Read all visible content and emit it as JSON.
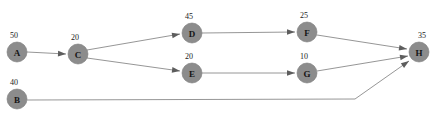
{
  "diagram": {
    "background_color": "#ffffff",
    "node_fill_color": "#8c8c8c",
    "edge_color": "#8a8a8a",
    "arrow_color": "#5d5d5d",
    "label_color": "#1a1a1a",
    "nodes": [
      {
        "id": "A",
        "label": "A",
        "weight": "50",
        "cx": 17,
        "cy": 52,
        "r": 10,
        "wx": 14,
        "wy": 38
      },
      {
        "id": "B",
        "label": "B",
        "weight": "40",
        "cx": 17,
        "cy": 99,
        "r": 10,
        "wx": 14,
        "wy": 85
      },
      {
        "id": "C",
        "label": "C",
        "weight": "20",
        "cx": 78,
        "cy": 54,
        "r": 10,
        "wx": 75,
        "wy": 40
      },
      {
        "id": "D",
        "label": "D",
        "weight": "45",
        "cx": 192,
        "cy": 33,
        "r": 10,
        "wx": 189,
        "wy": 19
      },
      {
        "id": "E",
        "label": "E",
        "weight": "20",
        "cx": 192,
        "cy": 73,
        "r": 10,
        "wx": 189,
        "wy": 59
      },
      {
        "id": "F",
        "label": "F",
        "weight": "25",
        "cx": 307,
        "cy": 32,
        "r": 10,
        "wx": 304,
        "wy": 18
      },
      {
        "id": "G",
        "label": "G",
        "weight": "10",
        "cx": 307,
        "cy": 73,
        "r": 10,
        "wx": 304,
        "wy": 59
      },
      {
        "id": "H",
        "label": "H",
        "weight": "35",
        "cx": 419,
        "cy": 52,
        "r": 10,
        "wx": 422,
        "wy": 38
      }
    ],
    "edges": [
      {
        "id": "A-C",
        "from": "A",
        "to": "C",
        "points": "27,52 66,54",
        "arrow_at": [
          66,
          54
        ],
        "arrow_angle": 3
      },
      {
        "id": "C-D",
        "from": "C",
        "to": "D",
        "points": "87,50 180,34",
        "arrow_at": [
          180,
          34
        ],
        "arrow_angle": -10
      },
      {
        "id": "C-E",
        "from": "C",
        "to": "E",
        "points": "87,58 180,71",
        "arrow_at": [
          180,
          71
        ],
        "arrow_angle": 8
      },
      {
        "id": "D-F",
        "from": "D",
        "to": "F",
        "points": "202,33 295,32",
        "arrow_at": [
          295,
          32
        ],
        "arrow_angle": 0
      },
      {
        "id": "E-G",
        "from": "E",
        "to": "G",
        "points": "202,73 295,73",
        "arrow_at": [
          295,
          73
        ],
        "arrow_angle": 0
      },
      {
        "id": "F-H",
        "from": "F",
        "to": "H",
        "points": "317,35 407,49",
        "arrow_at": [
          407,
          49
        ],
        "arrow_angle": 9
      },
      {
        "id": "G-H",
        "from": "G",
        "to": "H",
        "points": "317,71 408,56",
        "arrow_at": [
          408,
          56
        ],
        "arrow_angle": -10
      },
      {
        "id": "B-H",
        "from": "B",
        "to": "H",
        "points": "27,100 355,99 409,61",
        "arrow_at": [
          409,
          61
        ],
        "arrow_angle": -35
      }
    ]
  }
}
